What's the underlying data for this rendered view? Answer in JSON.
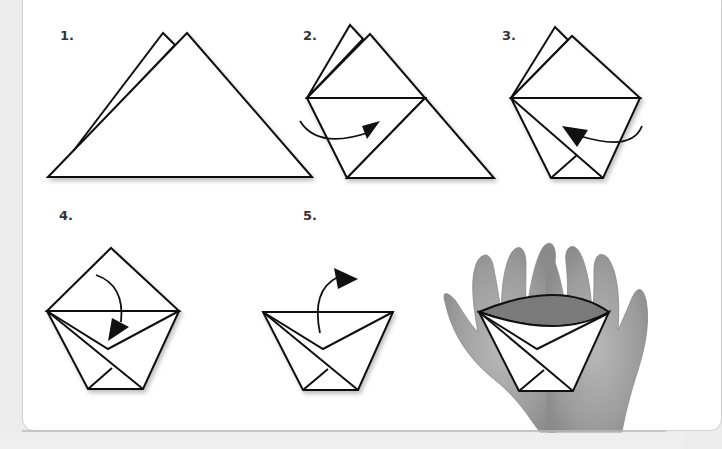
{
  "diagram": {
    "steps": [
      {
        "label": "1.",
        "description": "Fold square diagonally into a triangle"
      },
      {
        "label": "2.",
        "description": "Fold left corner across to the opposite edge"
      },
      {
        "label": "3.",
        "description": "Fold right corner across to the opposite side"
      },
      {
        "label": "4.",
        "description": "Fold the front top flap down"
      },
      {
        "label": "5.",
        "description": "Fold the back top flap down the other side"
      }
    ],
    "final": {
      "description": "Finished cup held in cupped hands"
    },
    "colors": {
      "line": "#111111",
      "paper": "#ffffff",
      "cup_opening": "#7a7a7a",
      "hands": "#a8a8a8",
      "background": "#ececec"
    }
  }
}
